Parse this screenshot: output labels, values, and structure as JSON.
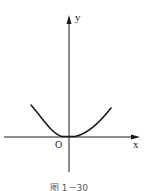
{
  "figure": {
    "axis_x_label": "x",
    "axis_y_label": "y",
    "origin_label": "O",
    "caption": "图 1－30",
    "curve": "parabola y = kx², opening upward, vertex at origin"
  },
  "colors": {
    "ink": "#1a1a1a",
    "background": "#ffffff"
  }
}
